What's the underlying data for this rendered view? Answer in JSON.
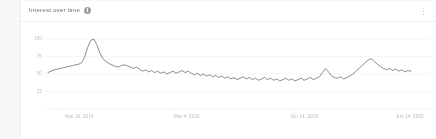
{
  "card": {
    "title": "Interest over time",
    "info_icon": "info-circle-icon",
    "menu_icon": "more-vertical-icon"
  },
  "chart_data": {
    "type": "line",
    "title": "Interest over time",
    "xlabel": "",
    "ylabel": "",
    "ylim": [
      0,
      110
    ],
    "grid": true,
    "legend": false,
    "yticks": [
      "100",
      "75",
      "50",
      "25"
    ],
    "ytick_values": [
      100,
      75,
      50,
      25
    ],
    "xticks": [
      "Nov 16, 2014",
      "Mar 4, 2016",
      "Oct 14, 2018",
      "Jun 14, 2020"
    ],
    "xtick_positions": [
      0.04,
      0.33,
      0.64,
      0.92
    ],
    "line_color": "#7a7f85",
    "series": [
      {
        "name": "Interest",
        "values": [
          52,
          54,
          56,
          57,
          58,
          59,
          60,
          61,
          62,
          63,
          64,
          66,
          74,
          88,
          98,
          100,
          92,
          80,
          72,
          68,
          65,
          63,
          61,
          60,
          62,
          63,
          62,
          60,
          58,
          60,
          57,
          54,
          56,
          53,
          55,
          52,
          54,
          51,
          53,
          50,
          52,
          54,
          51,
          53,
          55,
          52,
          54,
          51,
          49,
          51,
          48,
          50,
          47,
          49,
          46,
          48,
          45,
          47,
          44,
          46,
          43,
          45,
          42,
          44,
          46,
          43,
          45,
          42,
          44,
          41,
          43,
          45,
          42,
          44,
          41,
          43,
          40,
          42,
          44,
          41,
          43,
          40,
          42,
          44,
          41,
          43,
          45,
          42,
          44,
          46,
          52,
          58,
          53,
          47,
          45,
          44,
          46,
          43,
          45,
          47,
          50,
          54,
          58,
          62,
          66,
          70,
          72,
          68,
          64,
          61,
          58,
          56,
          58,
          55,
          57,
          54,
          56,
          53,
          55,
          54
        ]
      }
    ]
  }
}
